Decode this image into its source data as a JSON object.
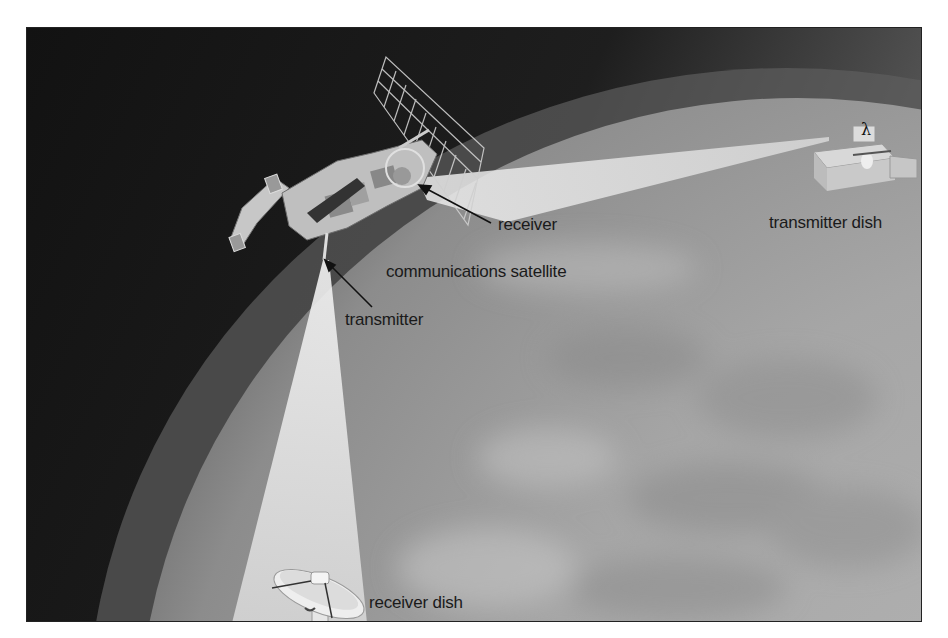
{
  "diagram": {
    "labels": {
      "receiver": "receiver",
      "communications_satellite": "communications satellite",
      "transmitter": "transmitter",
      "transmitter_dish": "transmitter dish",
      "receiver_dish": "receiver dish",
      "wavelength_symbol": "λ"
    },
    "nodes": [
      {
        "id": "transmitter-dish",
        "label": "transmitter dish"
      },
      {
        "id": "communications-satellite",
        "label": "communications satellite",
        "parts": [
          "receiver",
          "transmitter"
        ]
      },
      {
        "id": "receiver-dish",
        "label": "receiver dish"
      }
    ],
    "edges": [
      {
        "from": "transmitter-dish",
        "to": "receiver",
        "type": "uplink beam"
      },
      {
        "from": "transmitter",
        "to": "receiver-dish",
        "type": "downlink beam"
      }
    ],
    "colors": {
      "space": "#151515",
      "earth": "#a8a8a8",
      "beam": "#e4e4e4",
      "text": "#1a1a1a",
      "border": "#222222"
    }
  }
}
